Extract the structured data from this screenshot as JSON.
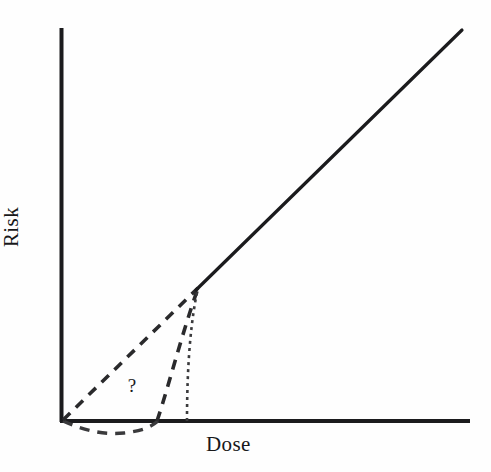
{
  "figure": {
    "background_color": "#fefefe",
    "ink_color": "#1b1b1d",
    "width": 491,
    "height": 472
  },
  "annotations": {
    "question_mark": "?"
  },
  "chart_data": {
    "type": "line",
    "title": "",
    "subtitle": "",
    "xlabel": "Dose",
    "ylabel": "Risk",
    "xlim": [
      0,
      1
    ],
    "ylim": [
      0,
      1
    ],
    "grid": false,
    "legend": null,
    "axis_style": {
      "spines": [
        "left",
        "bottom"
      ],
      "ticks": false,
      "tick_labels": false,
      "arrowheads": false,
      "origin_px": [
        60,
        422
      ],
      "x_axis_end_px": [
        470,
        422
      ],
      "y_axis_top_px": [
        60,
        28
      ]
    },
    "annotations": [
      {
        "text": "?",
        "x": 0.165,
        "y": 0.085,
        "note": "uncertainty in the low-dose extrapolation region"
      }
    ],
    "convergence_point": {
      "x": 0.337,
      "y": 0.34,
      "px": [
        198,
        288
      ],
      "note": "knee where all low-dose models meet the observed linear response"
    },
    "series": [
      {
        "name": "observed-linear-response",
        "style": "solid",
        "linewidth": 3.2,
        "color": "#1b1b1d",
        "x": [
          0.337,
          1.0
        ],
        "y": [
          0.34,
          1.0
        ],
        "points_px": [
          [
            198,
            288
          ],
          [
            462,
            30
          ]
        ],
        "note": "solid straight line from knee to upper right of plot"
      },
      {
        "name": "supralinear-extrapolation",
        "style": "dashed",
        "dash_pattern": [
          10,
          8
        ],
        "linewidth": 3.6,
        "color": "#2a2a2c",
        "x": [
          0.0,
          0.337
        ],
        "y": [
          0.0,
          0.34
        ],
        "points_px": [
          [
            63,
            420
          ],
          [
            198,
            288
          ]
        ],
        "note": "steep dashed line from origin up to the knee"
      },
      {
        "name": "sublinear-extrapolation",
        "style": "dashed",
        "dash_pattern": [
          10,
          8
        ],
        "linewidth": 3.6,
        "color": "#2a2a2c",
        "x": [
          0.238,
          0.337
        ],
        "y": [
          0.0,
          0.34
        ],
        "points_px": [
          [
            157,
            421
          ],
          [
            178,
            360
          ],
          [
            189,
            320
          ],
          [
            198,
            288
          ]
        ],
        "note": "curved dashed line rising from the axis near x=157px to the knee"
      },
      {
        "name": "threshold-extrapolation",
        "style": "dotted",
        "dash_pattern": [
          3,
          4
        ],
        "linewidth": 2.6,
        "color": "#3a3a3c",
        "x": [
          0.313,
          0.337
        ],
        "y": [
          0.0,
          0.34
        ],
        "points_px": [
          [
            187,
            421
          ],
          [
            189,
            370
          ],
          [
            192,
            325
          ],
          [
            198,
            288
          ]
        ],
        "note": "near-vertical dotted threshold curve meeting the knee"
      },
      {
        "name": "hormesis-extrapolation",
        "style": "dashed",
        "dash_pattern": [
          10,
          8
        ],
        "linewidth": 3.4,
        "color": "#3a3a3c",
        "x": [
          0.0,
          0.238
        ],
        "y": [
          0.0,
          0.0
        ],
        "points_px": [
          [
            63,
            421
          ],
          [
            95,
            428
          ],
          [
            120,
            433
          ],
          [
            142,
            430
          ],
          [
            157,
            421
          ]
        ],
        "note": "dashed curve dipping below the dose axis before returning to it"
      }
    ]
  }
}
